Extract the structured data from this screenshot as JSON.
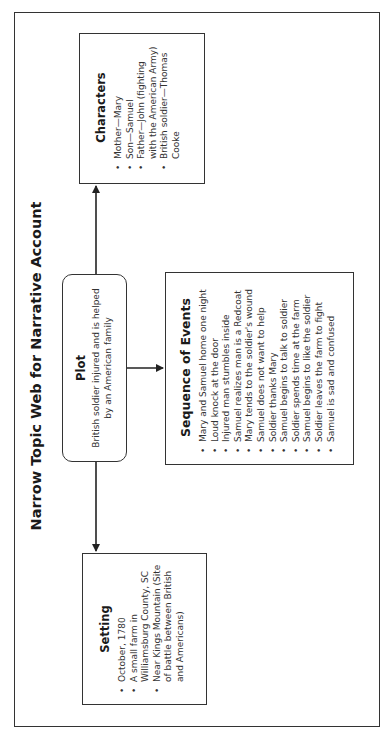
{
  "page": {
    "title": "Narrow Topic Web for Narrative Account",
    "orientation": "rotated-90-ccw"
  },
  "plot": {
    "heading": "Plot",
    "text": "British soldier injured and is helped by an American family"
  },
  "characters": {
    "heading": "Characters",
    "items": [
      "Mother—Mary",
      "Son—Samuel",
      "Father—John (fighting with the American Army)",
      "British soldier—Thomas Cooke"
    ]
  },
  "setting": {
    "heading": "Setting",
    "items": [
      "October, 1780",
      "A small farm in Williamsburg County, SC",
      "Near Kings Mountain (Site of battle between British and Americans)"
    ]
  },
  "sequence": {
    "heading": "Sequence of Events",
    "items": [
      "Mary and Samuel home one night",
      "Loud knock at the door",
      "Injured man stumbles inside",
      "Samuel realizes man is a Redcoat",
      "Mary tends to the soldier's wound",
      "Samuel does not want to help",
      "Soldier thanks Mary",
      "Samuel begins to talk to soldier",
      "Soldier spends time at the farm",
      "Samuel begins to like the soldier",
      "Soldier leaves the farm to fight",
      "Samuel is sad and confused"
    ]
  },
  "connectors": [
    {
      "from": "plot",
      "to": "characters"
    },
    {
      "from": "plot",
      "to": "setting"
    },
    {
      "from": "plot",
      "to": "sequence"
    }
  ]
}
